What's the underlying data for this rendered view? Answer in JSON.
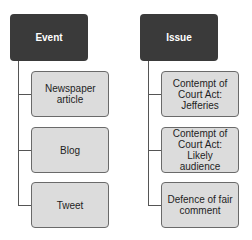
{
  "diagram": {
    "type": "hierarchy",
    "columns": [
      {
        "title": "Event",
        "children": [
          "Newspaper article",
          "Blog",
          "Tweet"
        ]
      },
      {
        "title": "Issue",
        "children": [
          "Contempt of Court Act: Jefferies",
          "Contempt of Court Act: Likely audience",
          "Defence of fair comment"
        ]
      }
    ],
    "colors": {
      "header_fill": "#3a3a3a",
      "header_text": "#ffffff",
      "child_fill": "#dcdcdc",
      "child_border": "#6a6a6a",
      "connector": "#555555"
    }
  }
}
